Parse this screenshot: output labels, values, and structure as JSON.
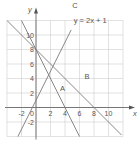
{
  "chart_data": {
    "type": "line",
    "title": "",
    "xlabel": "x",
    "ylabel": "y",
    "xlim": [
      -4,
      12
    ],
    "ylim": [
      -4,
      12
    ],
    "grid": true,
    "grid_step": 2,
    "x_ticks": [
      {
        "value": -2,
        "label": "-2"
      },
      {
        "value": 2,
        "label": "2"
      },
      {
        "value": 4,
        "label": "4"
      },
      {
        "value": 6,
        "label": "6"
      },
      {
        "value": 8,
        "label": "8"
      },
      {
        "value": 10,
        "label": "10"
      }
    ],
    "y_ticks": [
      {
        "value": -2,
        "label": "-2"
      },
      {
        "value": 2,
        "label": "2"
      },
      {
        "value": 4,
        "label": "4"
      },
      {
        "value": 6,
        "label": "6"
      },
      {
        "value": 8,
        "label": "8"
      },
      {
        "value": 10,
        "label": "10"
      }
    ],
    "origin_label": "0",
    "series": [
      {
        "name": "A",
        "equation": "y = 8 - 2x",
        "x": [
          -2,
          6
        ],
        "y": [
          12,
          -4
        ],
        "label_pos": [
          3.3,
          2.3
        ]
      },
      {
        "name": "B",
        "equation": "y = 8 - x",
        "x": [
          -4,
          11.8
        ],
        "y": [
          12,
          -3.8
        ],
        "label_pos": [
          6.7,
          4.0
        ]
      },
      {
        "name": "C",
        "equation": "y = 2x + 1",
        "x": [
          -2.5,
          4.85
        ],
        "y": [
          -4,
          10.7
        ],
        "label_pos": [
          5.0,
          13.7
        ]
      }
    ],
    "annotations": [
      {
        "text": "y = 2x + 1",
        "x": 5.2,
        "y": 11.7
      }
    ]
  }
}
